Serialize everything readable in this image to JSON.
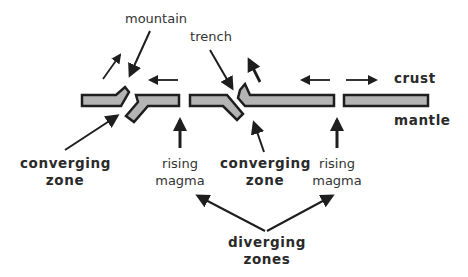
{
  "diagram": {
    "colors": {
      "plate_fill": "#b4b4b4",
      "plate_outline": "#1e1e1e",
      "arrow": "#1e1e1e",
      "text": "#2a2a2a",
      "background": "#ffffff"
    },
    "labels": {
      "mountain": "mountain",
      "trench": "trench",
      "crust": "crust",
      "mantle": "mantle",
      "converging_zone_left": [
        "converging",
        "zone"
      ],
      "converging_zone_right": [
        "converging",
        "zone"
      ],
      "rising_magma_left": [
        "rising",
        "magma"
      ],
      "rising_magma_right": [
        "rising",
        "magma"
      ],
      "diverging_zones": [
        "diverging",
        "zones"
      ]
    },
    "plates": [
      {
        "id": "plate-1",
        "description": "left plate with upturned mountain edge"
      },
      {
        "id": "plate-2",
        "description": "subducting plate bent downward at left"
      },
      {
        "id": "plate-3",
        "description": "plate subducting downward at right (trench)"
      },
      {
        "id": "plate-4",
        "description": "overriding plate with upturned left edge"
      },
      {
        "id": "plate-5",
        "description": "right plate moving away"
      }
    ],
    "motion_arrows": [
      {
        "id": "plate-1-motion",
        "direction": "up-right"
      },
      {
        "id": "plate-2-motion",
        "direction": "left"
      },
      {
        "id": "plate-4-up-motion",
        "direction": "up-left"
      },
      {
        "id": "plate-4-motion",
        "direction": "left"
      },
      {
        "id": "plate-5-motion",
        "direction": "right"
      },
      {
        "id": "magma-left",
        "direction": "up"
      },
      {
        "id": "magma-right",
        "direction": "up"
      }
    ]
  }
}
